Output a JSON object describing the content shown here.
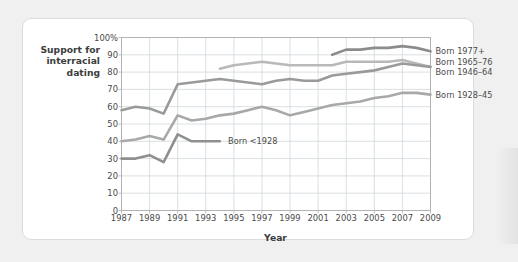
{
  "chart_data": {
    "type": "line",
    "title": "",
    "xlabel": "Year",
    "ylabel": "Support for interracial dating",
    "ylabel_lines": [
      "Support for",
      "interracial",
      "dating"
    ],
    "xlim": [
      1987,
      2009
    ],
    "ylim": [
      0,
      100
    ],
    "grid": true,
    "legend_position": "right-inline",
    "x_ticks": [
      "1987",
      "1989",
      "1991",
      "1993",
      "1995",
      "1997",
      "1999",
      "2001",
      "2003",
      "2005",
      "2007",
      "2009"
    ],
    "x_tick_values": [
      1987,
      1989,
      1991,
      1993,
      1995,
      1997,
      1999,
      2001,
      2003,
      2005,
      2007,
      2009
    ],
    "y_ticks": [
      "0",
      "10",
      "20",
      "30",
      "40",
      "50",
      "60",
      "70",
      "80",
      "90",
      "100%"
    ],
    "y_tick_values": [
      0,
      10,
      20,
      30,
      40,
      50,
      60,
      70,
      80,
      90,
      100
    ],
    "series": [
      {
        "name": "Born 1977+",
        "label": "Born 1977+",
        "color": "#8c8c8c",
        "label_x": 2009.6,
        "label_y": 92,
        "x": [
          2002,
          2003,
          2004,
          2005,
          2006,
          2007,
          2008,
          2009
        ],
        "values": [
          90,
          93,
          93,
          94,
          94,
          95,
          94,
          92
        ]
      },
      {
        "name": "Born 1965-76",
        "label": "Born 1965–76",
        "color": "#b9b9b9",
        "label_x": 2009.6,
        "label_y": 86,
        "x": [
          1994,
          1995,
          1996,
          1997,
          1998,
          1999,
          2000,
          2001,
          2002,
          2003,
          2004,
          2005,
          2006,
          2007,
          2008,
          2009
        ],
        "values": [
          82,
          84,
          85,
          86,
          85,
          84,
          84,
          84,
          84,
          86,
          86,
          86,
          86,
          87,
          85,
          83
        ]
      },
      {
        "name": "Born 1946-64",
        "label": "Born 1946–64",
        "color": "#9a9a9a",
        "label_x": 2009.6,
        "label_y": 80,
        "x": [
          1987,
          1988,
          1989,
          1990,
          1991,
          1992,
          1993,
          1994,
          1995,
          1996,
          1997,
          1998,
          1999,
          2000,
          2001,
          2002,
          2003,
          2004,
          2005,
          2006,
          2007,
          2008,
          2009
        ],
        "values": [
          58,
          60,
          59,
          56,
          73,
          74,
          75,
          76,
          75,
          74,
          73,
          75,
          76,
          75,
          75,
          78,
          79,
          80,
          81,
          83,
          85,
          84,
          83
        ]
      },
      {
        "name": "Born 1928-45",
        "label": "Born 1928–45",
        "color": "#a8a8a8",
        "label_x": 2009.6,
        "label_y": 67,
        "x": [
          1987,
          1988,
          1989,
          1990,
          1991,
          1992,
          1993,
          1994,
          1995,
          1996,
          1997,
          1998,
          1999,
          2000,
          2001,
          2002,
          2003,
          2004,
          2005,
          2006,
          2007,
          2008,
          2009
        ],
        "values": [
          40,
          41,
          43,
          41,
          55,
          52,
          53,
          55,
          56,
          58,
          60,
          58,
          55,
          57,
          59,
          61,
          62,
          63,
          65,
          66,
          68,
          68,
          67
        ]
      },
      {
        "name": "Born <1928",
        "label": "Born <1928",
        "color": "#8f8f8f",
        "label_x": 1994.3,
        "label_y": 40,
        "inline_label": true,
        "x": [
          1987,
          1988,
          1989,
          1990,
          1991,
          1992,
          1993,
          1994
        ],
        "values": [
          30,
          30,
          32,
          28,
          44,
          40,
          40,
          40
        ]
      }
    ]
  },
  "style": {
    "grid_color": "#cfd8dc",
    "axis_color": "#b0b0b0",
    "text_color": "#4a4a4a",
    "card_background": "#ffffff",
    "page_background": "#f0f0f0"
  }
}
